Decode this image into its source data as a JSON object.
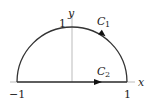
{
  "diagram": {
    "type": "contour",
    "axes": {
      "x_label": "x",
      "y_label": "y"
    },
    "ticks": {
      "x_left": "−1",
      "x_right": "1",
      "y_top": "1"
    },
    "curves": [
      {
        "name": "C",
        "subscript": "1",
        "kind": "semicircle arc",
        "direction": "counterclockwise (arrow on arc)"
      },
      {
        "name": "C",
        "subscript": "2",
        "kind": "segment on x-axis",
        "direction": "left to right"
      }
    ],
    "colors": {
      "curve": "#333333",
      "axis": "#999999",
      "text": "#222222"
    }
  }
}
